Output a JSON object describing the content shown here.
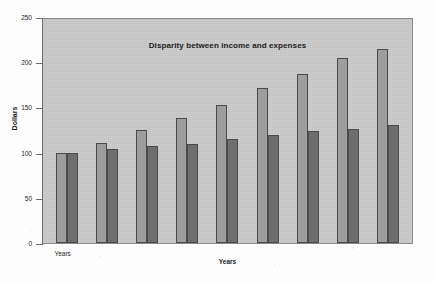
{
  "chart_data": {
    "type": "bar",
    "title": "Disparity between income and expenses",
    "xlabel": "Years",
    "ylabel": "Dollars",
    "ylim": [
      0,
      250
    ],
    "yticks": [
      0,
      50,
      100,
      150,
      200,
      250
    ],
    "grid": false,
    "legend": "none",
    "categories": [
      "Years",
      "",
      "",
      "",
      "",
      "",
      "",
      "",
      ""
    ],
    "category_tick_labels": [
      "Years"
    ],
    "series": [
      {
        "name": "income",
        "color": "#9d9d9d",
        "values": [
          100,
          111,
          125,
          138,
          153,
          171,
          187,
          205,
          215
        ]
      },
      {
        "name": "expenses",
        "color": "#6e6e6e",
        "values": [
          100,
          104,
          107,
          110,
          115,
          119,
          124,
          126,
          130
        ]
      }
    ]
  },
  "figure": {
    "plot_background": "#c9c9c9",
    "page_background": "#fdfdfd",
    "axis_color": "#6d6d6d"
  }
}
